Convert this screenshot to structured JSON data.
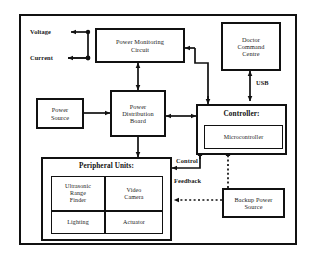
{
  "diagram": {
    "frame": {
      "name": "outer-frame"
    },
    "blocks": {
      "power_monitoring": {
        "label": "Power Monitoring\nCircuit"
      },
      "doctor_command": {
        "label": "Doctor\nCommand\nCentre"
      },
      "power_source": {
        "label": "Power\nSource"
      },
      "power_distribution": {
        "label": "Power\nDistribution\nBoard"
      },
      "controller": {
        "label": "Controller:"
      },
      "microcontroller": {
        "label": "Microcontroller"
      },
      "peripheral_units": {
        "label": "Peripheral Units:"
      },
      "ultrasonic": {
        "label": "Ultrasonic\nRange\nFinder"
      },
      "video_camera": {
        "label": "Video\nCamera"
      },
      "lighting": {
        "label": "Lighting"
      },
      "actuator": {
        "label": "Actuator"
      },
      "backup_power": {
        "label": "Backup Power\nSource"
      }
    },
    "edge_labels": {
      "voltage": "Voltage",
      "current": "Current",
      "usb": "USB",
      "control": "Control",
      "feedback": "Feedback"
    },
    "colors": {
      "line": "#111111",
      "background": "#ffffff",
      "text": "#1a1a1a"
    }
  }
}
